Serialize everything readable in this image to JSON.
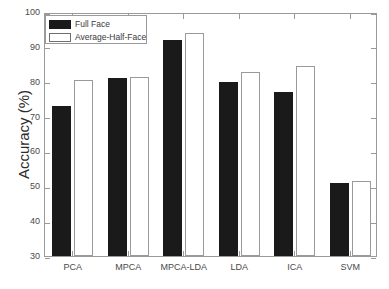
{
  "chart_data": {
    "type": "bar",
    "title": "",
    "xlabel": "",
    "ylabel": "Accuracy (%)",
    "ylim": [
      30,
      100
    ],
    "ytick_labels": [
      "30",
      "40",
      "50",
      "60",
      "70",
      "80",
      "90",
      "100"
    ],
    "yticks": [
      30,
      40,
      50,
      60,
      70,
      80,
      90,
      100
    ],
    "grid": false,
    "legend_position": "upper-left",
    "categories": [
      "PCA",
      "MPCA",
      "MPCA-LDA",
      "LDA",
      "ICA",
      "SVM"
    ],
    "series": [
      {
        "name": "Full Face",
        "color": "#1a1a1a",
        "values": [
          73,
          81,
          92,
          80,
          77,
          51
        ]
      },
      {
        "name": "Average-Half-Face",
        "color": "#ffffff",
        "values": [
          80.5,
          81.3,
          94,
          82.8,
          84.5,
          51.6
        ]
      }
    ]
  },
  "legend": {
    "entries": [
      {
        "label": "Full Face"
      },
      {
        "label": "Average-Half-Face"
      }
    ]
  },
  "colors": {
    "full_face": "#1a1a1a",
    "half_face_fill": "#ffffff",
    "half_face_edge": "#9a9a9a",
    "axis": "#9a9a9a",
    "text": "#3a3a3a"
  }
}
